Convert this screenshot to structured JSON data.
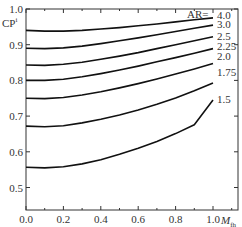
{
  "chart_data": {
    "type": "line",
    "title": "",
    "xlabel": "M_fh",
    "ylabel": "CP^i",
    "xlim": [
      0.0,
      1.1
    ],
    "ylim": [
      0.45,
      1.0
    ],
    "xticks": [
      "0.0",
      "0.2",
      "0.4",
      "0.6",
      "0.8",
      "1.0"
    ],
    "yticks": [
      "0.5",
      "0.6",
      "0.7",
      "0.8",
      "0.9",
      "1.0"
    ],
    "legend_title": "AR=",
    "x": [
      0.0,
      0.1,
      0.2,
      0.3,
      0.4,
      0.5,
      0.6,
      0.7,
      0.8,
      0.9,
      1.0
    ],
    "series": [
      {
        "name": "4.0",
        "values": [
          0.94,
          0.938,
          0.938,
          0.94,
          0.944,
          0.948,
          0.953,
          0.958,
          0.964,
          0.97,
          0.975
        ]
      },
      {
        "name": "3.0",
        "values": [
          0.89,
          0.889,
          0.891,
          0.896,
          0.903,
          0.911,
          0.919,
          0.928,
          0.937,
          0.946,
          0.955
        ]
      },
      {
        "name": "2.5",
        "values": [
          0.843,
          0.842,
          0.845,
          0.851,
          0.859,
          0.868,
          0.878,
          0.889,
          0.9,
          0.911,
          0.922
        ]
      },
      {
        "name": "2.25",
        "values": [
          0.8,
          0.8,
          0.803,
          0.81,
          0.819,
          0.829,
          0.84,
          0.852,
          0.864,
          0.876,
          0.889
        ]
      },
      {
        "name": "2.0",
        "values": [
          0.75,
          0.749,
          0.752,
          0.759,
          0.768,
          0.779,
          0.791,
          0.804,
          0.818,
          0.832,
          0.847
        ]
      },
      {
        "name": "1.75",
        "values": [
          0.672,
          0.67,
          0.673,
          0.681,
          0.691,
          0.703,
          0.717,
          0.733,
          0.751,
          0.771,
          0.793
        ]
      },
      {
        "name": "1.5",
        "values": [
          0.557,
          0.555,
          0.558,
          0.566,
          0.578,
          0.593,
          0.61,
          0.629,
          0.651,
          0.676,
          0.745
        ]
      }
    ],
    "grid": false,
    "legend_position": "inline-right"
  },
  "labels": {
    "ylabel_main": "CP",
    "ylabel_sup": "i",
    "xlabel_main": "M",
    "xlabel_sub": "fh",
    "legend_title": "AR="
  }
}
